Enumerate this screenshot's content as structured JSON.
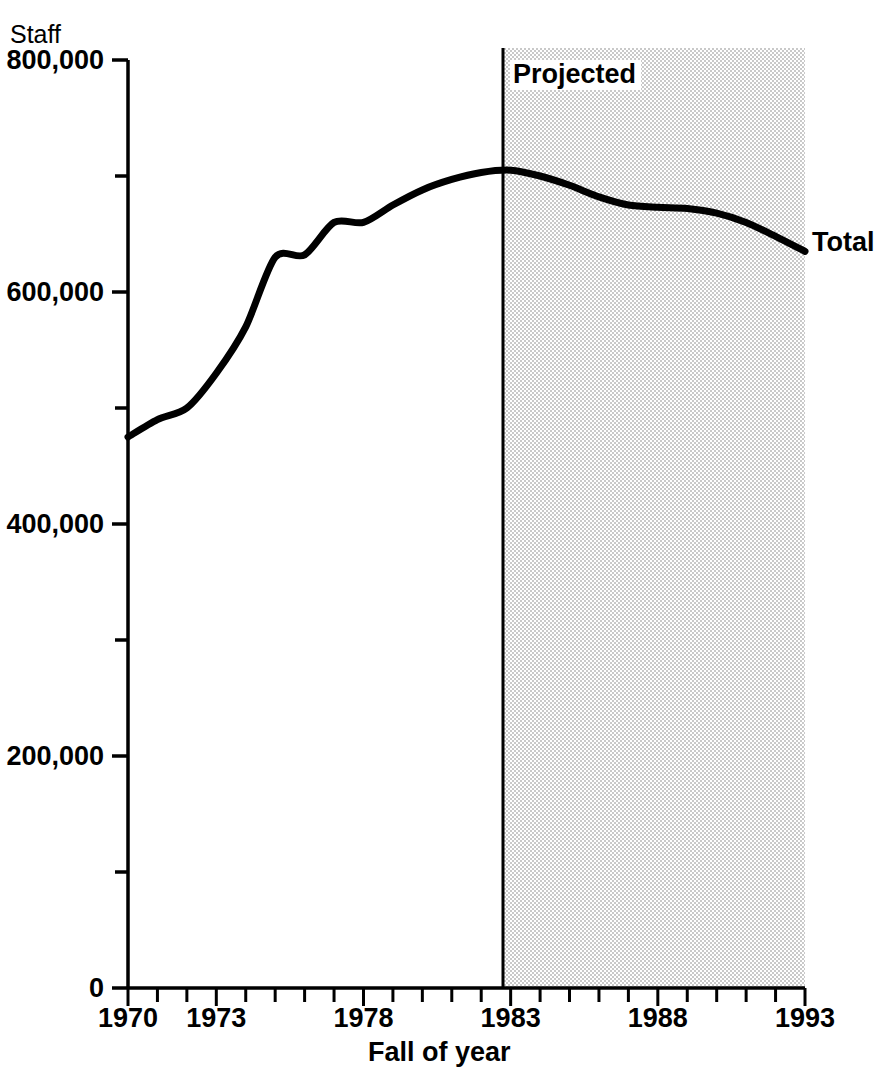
{
  "chart_data": {
    "type": "line",
    "title": "",
    "subtitle": "",
    "ylabel": "Staff",
    "xlabel": "Fall of year",
    "xlim": [
      1970,
      1993
    ],
    "ylim": [
      0,
      800000
    ],
    "grid": false,
    "legend_position": "inline-end-of-line",
    "y_ticks_major": [
      0,
      200000,
      400000,
      600000,
      800000
    ],
    "y_tick_labels": [
      "0",
      "200,000",
      "400,000",
      "600,000",
      "800,000"
    ],
    "y_ticks_minor": [
      100000,
      300000,
      500000,
      700000
    ],
    "x_ticks": [
      1970,
      1971,
      1972,
      1973,
      1974,
      1975,
      1976,
      1977,
      1978,
      1979,
      1980,
      1981,
      1982,
      1983,
      1984,
      1985,
      1986,
      1987,
      1988,
      1989,
      1990,
      1991,
      1992,
      1993
    ],
    "x_tick_labels": [
      {
        "year": 1970,
        "label": "1970"
      },
      {
        "year": 1973,
        "label": "1973"
      },
      {
        "year": 1978,
        "label": "1978"
      },
      {
        "year": 1983,
        "label": "1983"
      },
      {
        "year": 1988,
        "label": "1988"
      },
      {
        "year": 1993,
        "label": "1993"
      }
    ],
    "series": [
      {
        "name": "Total",
        "x": [
          1970,
          1971,
          1972,
          1973,
          1974,
          1975,
          1976,
          1977,
          1978,
          1979,
          1980,
          1981,
          1982,
          1983,
          1984,
          1985,
          1986,
          1987,
          1988,
          1989,
          1990,
          1991,
          1992,
          1993
        ],
        "values": [
          475000,
          490000,
          500000,
          530000,
          570000,
          630000,
          632000,
          660000,
          660000,
          675000,
          688000,
          697000,
          703000,
          705000,
          700000,
          692000,
          682000,
          675000,
          673000,
          672000,
          668000,
          660000,
          648000,
          635000
        ]
      }
    ],
    "annotations": [
      {
        "name": "projected-region",
        "label": "Projected",
        "x_start": 1983,
        "x_end": 1993,
        "shaded": true
      },
      {
        "name": "series-end-label",
        "label": "Total",
        "x": 1993
      }
    ],
    "colors": {
      "line": "#000000",
      "axis": "#000000",
      "projected_shading": "#d9d9d9",
      "background": "#ffffff"
    }
  },
  "labels": {
    "y_axis_unit": "Staff",
    "x_axis_title": "Fall of year",
    "projected": "Projected",
    "total": "Total"
  }
}
